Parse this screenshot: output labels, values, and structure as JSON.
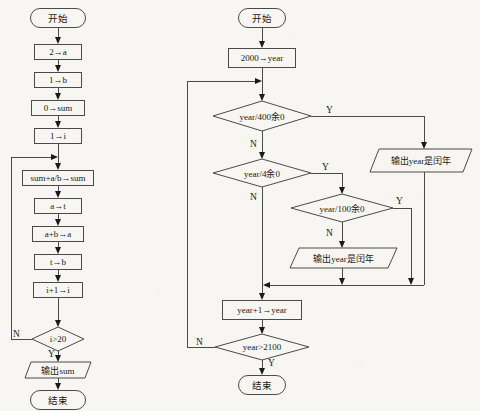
{
  "page": {
    "background_color": "#f7f6f2",
    "line_color": "#4a4a4a",
    "text_color": "#1a1a1a"
  },
  "flowchart_left": {
    "name": "分数数列求和算法流程图",
    "nodes": {
      "start": "开始",
      "init_a": "2→a",
      "init_b": "1→b",
      "init_sum": "0→sum",
      "init_i": "1→i",
      "accumulate": "sum+a/b→sum",
      "save_t": "a→t",
      "update_a": "a+b→a",
      "update_b": "t→b",
      "increment_i": "i+1→i",
      "condition": "i>20",
      "output": "输出sum",
      "end": "结束"
    },
    "branch_labels": {
      "yes": "Y",
      "no": "N"
    }
  },
  "flowchart_right": {
    "name": "闰年判断算法流程图",
    "nodes": {
      "start": "开始",
      "init_year": "2000→year",
      "cond_400": "year/400余0",
      "cond_4": "year/4余0",
      "cond_100": "year/100余0",
      "output_leap_1": "输出year是闰年",
      "output_leap_2": "输出year是闰年",
      "increment_year": "year+1→year",
      "cond_end": "year>2100",
      "end": "结束"
    },
    "branch_labels": {
      "yes_400": "Y",
      "no_400": "N",
      "yes_4": "Y",
      "no_4": "N",
      "yes_100": "Y",
      "no_100": "N",
      "yes_end": "Y",
      "no_end": "N"
    }
  }
}
